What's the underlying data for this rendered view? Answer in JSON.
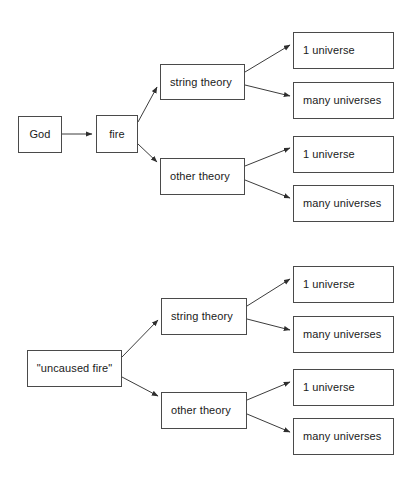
{
  "document": {
    "title": "Two causal-tree diagrams comparing God-caused fire versus uncaused fire",
    "background_color": "#ffffff",
    "line_color": "#3c3c3c",
    "box_border_color": "#4a4a4a",
    "text_color": "#1a1a1a"
  },
  "diagrams": [
    {
      "id": "top-diagram",
      "name": "god-caused-fire-tree",
      "nodes": {
        "root": {
          "label": "God",
          "x": 18,
          "y": 116,
          "w": 44,
          "h": 37,
          "align": "center"
        },
        "cause": {
          "label": "fire",
          "x": 96,
          "y": 115,
          "w": 42,
          "h": 38,
          "align": "center"
        },
        "branch_a": {
          "label": "string theory",
          "x": 160,
          "y": 64,
          "w": 85,
          "h": 36,
          "align": "left"
        },
        "branch_b": {
          "label": "other theory",
          "x": 160,
          "y": 158,
          "w": 85,
          "h": 37,
          "align": "left"
        },
        "leaf_a1": {
          "label": "1 universe",
          "x": 293,
          "y": 32,
          "w": 101,
          "h": 37,
          "align": "left"
        },
        "leaf_a2": {
          "label": "many universes",
          "x": 293,
          "y": 82,
          "w": 101,
          "h": 37,
          "align": "left"
        },
        "leaf_b1": {
          "label": "1 universe",
          "x": 293,
          "y": 136,
          "w": 101,
          "h": 37,
          "align": "left"
        },
        "leaf_b2": {
          "label": "many universes",
          "x": 293,
          "y": 185,
          "w": 101,
          "h": 37,
          "align": "left"
        }
      },
      "edges": [
        {
          "from": "root",
          "to": "cause",
          "x1": 62,
          "y1": 134,
          "x2": 94,
          "y2": 134
        },
        {
          "from": "cause",
          "to": "branch_a",
          "x1": 138,
          "y1": 122,
          "x2": 158,
          "y2": 85
        },
        {
          "from": "cause",
          "to": "branch_b",
          "x1": 138,
          "y1": 144,
          "x2": 158,
          "y2": 163
        },
        {
          "from": "branch_a",
          "to": "leaf_a1",
          "x1": 245,
          "y1": 72,
          "x2": 291,
          "y2": 44
        },
        {
          "from": "branch_a",
          "to": "leaf_a2",
          "x1": 245,
          "y1": 85,
          "x2": 291,
          "y2": 97
        },
        {
          "from": "branch_b",
          "to": "leaf_b1",
          "x1": 245,
          "y1": 166,
          "x2": 291,
          "y2": 147
        },
        {
          "from": "branch_b",
          "to": "leaf_b2",
          "x1": 245,
          "y1": 180,
          "x2": 291,
          "y2": 199
        }
      ]
    },
    {
      "id": "bottom-diagram",
      "name": "uncaused-fire-tree",
      "nodes": {
        "root": {
          "label": "\"uncaused fire\"",
          "x": 27,
          "y": 350,
          "w": 95,
          "h": 37,
          "align": "center"
        },
        "branch_a": {
          "label": "string theory",
          "x": 161,
          "y": 298,
          "w": 86,
          "h": 37,
          "align": "left"
        },
        "branch_b": {
          "label": "other theory",
          "x": 161,
          "y": 392,
          "w": 86,
          "h": 37,
          "align": "left"
        },
        "leaf_a1": {
          "label": "1 universe",
          "x": 293,
          "y": 266,
          "w": 101,
          "h": 37,
          "align": "left"
        },
        "leaf_a2": {
          "label": "many universes",
          "x": 293,
          "y": 316,
          "w": 101,
          "h": 37,
          "align": "left"
        },
        "leaf_b1": {
          "label": "1 universe",
          "x": 293,
          "y": 369,
          "w": 101,
          "h": 37,
          "align": "left"
        },
        "leaf_b2": {
          "label": "many universes",
          "x": 293,
          "y": 418,
          "w": 101,
          "h": 37,
          "align": "left"
        }
      },
      "edges": [
        {
          "from": "root",
          "to": "branch_a",
          "x1": 122,
          "y1": 356,
          "x2": 159,
          "y2": 318
        },
        {
          "from": "root",
          "to": "branch_b",
          "x1": 122,
          "y1": 377,
          "x2": 159,
          "y2": 397
        },
        {
          "from": "branch_a",
          "to": "leaf_a1",
          "x1": 247,
          "y1": 306,
          "x2": 291,
          "y2": 278
        },
        {
          "from": "branch_a",
          "to": "leaf_a2",
          "x1": 247,
          "y1": 319,
          "x2": 291,
          "y2": 331
        },
        {
          "from": "branch_b",
          "to": "leaf_b1",
          "x1": 247,
          "y1": 400,
          "x2": 291,
          "y2": 381
        },
        {
          "from": "branch_b",
          "to": "leaf_b2",
          "x1": 247,
          "y1": 414,
          "x2": 291,
          "y2": 433
        }
      ]
    }
  ]
}
